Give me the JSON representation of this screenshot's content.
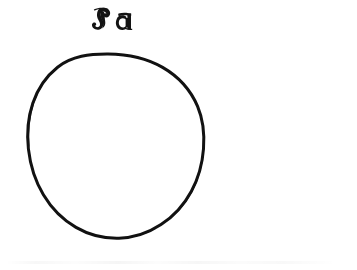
{
  "figure": {
    "label": "Ja",
    "label_script": "fraktur",
    "label_reading": "Ja",
    "background_color": "#ffffff",
    "ink_color": "#121212",
    "canvas": {
      "width": 357,
      "height": 270
    },
    "shapes": [
      {
        "name": "outline-circle",
        "type": "circle",
        "center_x": 108,
        "center_y": 155,
        "radius_x": 95,
        "radius_y": 101,
        "stroke_width": 3,
        "fill": "none",
        "stroke_color": "#121212",
        "style": "hand-drawn engraved outline"
      }
    ],
    "label_position": {
      "x": 113,
      "y": 19
    },
    "interior": "empty"
  }
}
